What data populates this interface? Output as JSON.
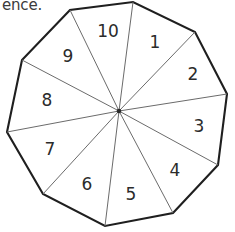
{
  "page": {
    "background_color": "#ffffff",
    "cut_off_text": "ence."
  },
  "figure": {
    "type": "decagon-pie-diagram",
    "sides": 10,
    "outline_color": "#1f1f1f",
    "spoke_color": "#6b6b6b",
    "label_color": "#2b2b2b",
    "center": {
      "x": 119,
      "y": 111
    },
    "radius": 112,
    "vertices": [
      {
        "x": 70,
        "y": 10
      },
      {
        "x": 22,
        "y": 60
      },
      {
        "x": 7,
        "y": 132
      },
      {
        "x": 43,
        "y": 194
      },
      {
        "x": 105,
        "y": 226
      },
      {
        "x": 173,
        "y": 213
      },
      {
        "x": 218,
        "y": 165
      },
      {
        "x": 227,
        "y": 94
      },
      {
        "x": 195,
        "y": 32
      },
      {
        "x": 133,
        "y": 2
      }
    ],
    "sectors": [
      {
        "id": "sector-1",
        "label": "1",
        "label_x": 155,
        "label_y": 43
      },
      {
        "id": "sector-2",
        "label": "2",
        "label_x": 193,
        "label_y": 75
      },
      {
        "id": "sector-3",
        "label": "3",
        "label_x": 199,
        "label_y": 127
      },
      {
        "id": "sector-4",
        "label": "4",
        "label_x": 175,
        "label_y": 171
      },
      {
        "id": "sector-5",
        "label": "5",
        "label_x": 131,
        "label_y": 195
      },
      {
        "id": "sector-6",
        "label": "6",
        "label_x": 87,
        "label_y": 185
      },
      {
        "id": "sector-7",
        "label": "7",
        "label_x": 50,
        "label_y": 150
      },
      {
        "id": "sector-8",
        "label": "8",
        "label_x": 47,
        "label_y": 101
      },
      {
        "id": "sector-9",
        "label": "9",
        "label_x": 68,
        "label_y": 57
      },
      {
        "id": "sector-10",
        "label": "10",
        "label_x": 108,
        "label_y": 32
      }
    ]
  }
}
